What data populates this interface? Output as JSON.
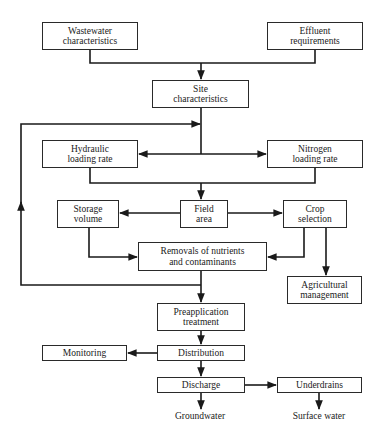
{
  "diagram": {
    "nodes": {
      "wastewater": {
        "line1": "Wastewater",
        "line2": "characteristics"
      },
      "effluent": {
        "line1": "Effluent",
        "line2": "requirements"
      },
      "site": {
        "line1": "Site",
        "line2": "characteristics"
      },
      "hydraulic": {
        "line1": "Hydraulic",
        "line2": "loading rate"
      },
      "nitrogen": {
        "line1": "Nitrogen",
        "line2": "loading rate"
      },
      "storage": {
        "line1": "Storage",
        "line2": "volume"
      },
      "field": {
        "line1": "Field",
        "line2": "area"
      },
      "crop": {
        "line1": "Crop",
        "line2": "selection"
      },
      "removals": {
        "line1": "Removals of nutrients",
        "line2": "and contaminants"
      },
      "agricultural": {
        "line1": "Agricultural",
        "line2": "management"
      },
      "preapplication": {
        "line1": "Preapplication",
        "line2": "treatment"
      },
      "distribution": {
        "line1": "Distribution"
      },
      "monitoring": {
        "line1": "Monitoring"
      },
      "discharge": {
        "line1": "Discharge"
      },
      "underdrains": {
        "line1": "Underdrains"
      }
    },
    "outputs": {
      "groundwater": "Groundwater",
      "surface_water": "Surface water"
    },
    "edges": [
      [
        "wastewater",
        "site"
      ],
      [
        "effluent",
        "site"
      ],
      [
        "site",
        "hydraulic"
      ],
      [
        "site",
        "nitrogen"
      ],
      [
        "hydraulic",
        "field"
      ],
      [
        "nitrogen",
        "field"
      ],
      [
        "field",
        "storage"
      ],
      [
        "field",
        "crop"
      ],
      [
        "storage",
        "removals"
      ],
      [
        "crop",
        "removals"
      ],
      [
        "crop",
        "agricultural"
      ],
      [
        "removals",
        "preapplication"
      ],
      [
        "removals",
        "site"
      ],
      [
        "preapplication",
        "distribution"
      ],
      [
        "distribution",
        "monitoring"
      ],
      [
        "distribution",
        "discharge"
      ],
      [
        "discharge",
        "underdrains"
      ],
      [
        "discharge",
        "groundwater"
      ],
      [
        "underdrains",
        "surface_water"
      ]
    ],
    "line_color": "#1a1a1a"
  }
}
